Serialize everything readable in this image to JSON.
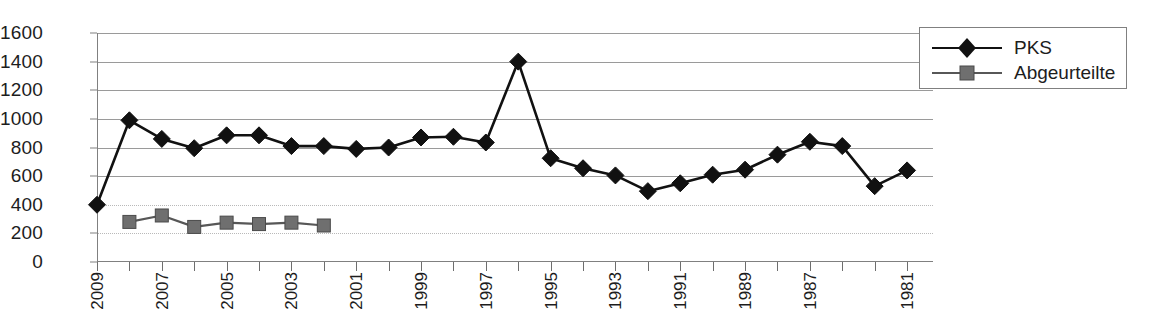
{
  "chart_data": {
    "type": "line",
    "title": "",
    "xlabel": "",
    "ylabel": "",
    "ylim": [
      0,
      1600
    ],
    "ytick_step": 200,
    "yticks": [
      1600,
      1400,
      1200,
      1000,
      800,
      600,
      400,
      200,
      0
    ],
    "grid": true,
    "x_axis_reversed": true,
    "legend_position": "right",
    "categories": [
      "2009",
      "2008",
      "2007",
      "2006",
      "2005",
      "2004",
      "2003",
      "2002",
      "2001",
      "2000",
      "1999",
      "1998",
      "1997",
      "1996",
      "1995",
      "1994",
      "1993",
      "1992",
      "1991",
      "1990",
      "1989",
      "1988",
      "1987",
      "1986",
      "1985",
      "1981"
    ],
    "xtick_labels": [
      "2009",
      "",
      "2007",
      "",
      "2005",
      "",
      "2003",
      "",
      "2001",
      "",
      "1999",
      "",
      "1997",
      "",
      "1995",
      "",
      "1993",
      "",
      "1991",
      "",
      "1989",
      "",
      "1987",
      "",
      "",
      "1981"
    ],
    "series": [
      {
        "name": "PKS",
        "marker": "diamond",
        "color": "#111111",
        "values": [
          400,
          990,
          860,
          795,
          885,
          885,
          810,
          810,
          790,
          800,
          870,
          875,
          835,
          1400,
          725,
          655,
          605,
          495,
          550,
          610,
          645,
          750,
          840,
          810,
          530,
          640
        ]
      },
      {
        "name": "Abgeurteilte",
        "marker": "square",
        "color": "#6f6f6f",
        "values": [
          null,
          280,
          325,
          245,
          275,
          265,
          275,
          255,
          null,
          null,
          null,
          null,
          null,
          null,
          null,
          null,
          null,
          null,
          null,
          null,
          null,
          null,
          null,
          null,
          null,
          null
        ]
      }
    ]
  },
  "legend": {
    "items": [
      {
        "label": "PKS",
        "marker": "diamond",
        "color": "#111111"
      },
      {
        "label": "Abgeurteilte",
        "marker": "square",
        "color": "#6f6f6f"
      }
    ]
  },
  "colors": {
    "background": "#ffffff",
    "axis": "#808080",
    "grid": "#9a9a9a",
    "text": "#1d1d1d",
    "series_pks": "#111111",
    "series_abgeurteilte": "#6f6f6f"
  }
}
